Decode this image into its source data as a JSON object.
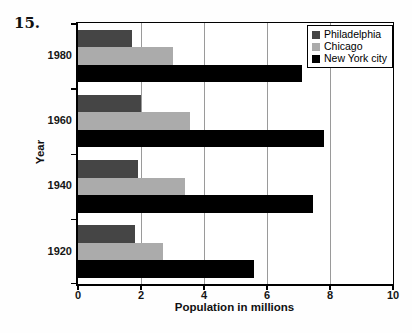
{
  "page": {
    "problem_number": "15."
  },
  "chart_data": {
    "type": "bar",
    "orientation": "horizontal",
    "title": "",
    "xlabel": "Population in millions",
    "ylabel": "Year",
    "xlim": [
      0,
      10
    ],
    "xticks": [
      0,
      2,
      4,
      6,
      8,
      10
    ],
    "gridlines": [
      2,
      4,
      6,
      8
    ],
    "grid": "vertical-on",
    "legend_position": "top-right",
    "categories": [
      "1980",
      "1960",
      "1940",
      "1920"
    ],
    "series": [
      {
        "name": "Philadelphia",
        "color": "#454545",
        "values": [
          1.7,
          2.0,
          1.9,
          1.8
        ]
      },
      {
        "name": "Chicago",
        "color": "#ababab",
        "values": [
          3.0,
          3.55,
          3.4,
          2.7
        ]
      },
      {
        "name": "New York city",
        "color": "#000000",
        "values": [
          7.1,
          7.8,
          7.45,
          5.6
        ]
      }
    ]
  }
}
